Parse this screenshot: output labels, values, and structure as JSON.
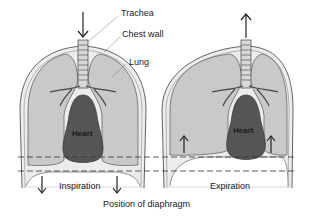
{
  "labels": {
    "trachea": "Trachea",
    "chest_wall": "Chest wall",
    "lung": "Lung",
    "heart_left": "Heart",
    "heart_right": "Heart",
    "inspiration": "Inspiration",
    "expiration": "Expiration",
    "diaphragm_position": "Position of diaphragm"
  },
  "panels": [
    {
      "name": "inspiration",
      "airflow": "in",
      "diaphragm": "down"
    },
    {
      "name": "expiration",
      "airflow": "out",
      "diaphragm": "up"
    }
  ],
  "colors": {
    "chest_cavity": "#e4e4e4",
    "lung": "#c8c8c8",
    "heart": "#555555",
    "outline": "#555555",
    "background": "#ffffff"
  }
}
